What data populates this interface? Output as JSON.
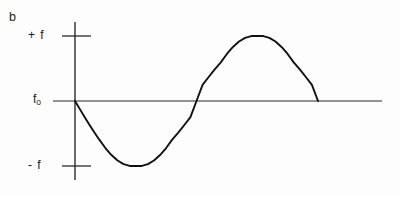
{
  "figure": {
    "panel_letter": "b",
    "background_color": "#fdfdfd",
    "ink_color": "#1a1a1a"
  },
  "axis_labels": {
    "positive_deviation": "+ f",
    "center_frequency_symbol": "f",
    "center_frequency_subscript": "o",
    "negative_deviation": "- f"
  },
  "chart_data": {
    "type": "line",
    "title": "",
    "subtitle": "",
    "xlabel": "",
    "ylabel": "",
    "grid": false,
    "legend_position": "none",
    "annotations": [
      "b"
    ],
    "x": [
      0.0,
      0.02,
      0.04,
      0.06,
      0.08,
      0.1,
      0.125,
      0.15,
      0.175,
      0.2,
      0.225,
      0.25,
      0.275,
      0.3,
      0.325,
      0.35,
      0.375,
      0.4,
      0.425,
      0.45,
      0.475,
      0.5,
      0.525,
      0.55,
      0.575,
      0.6,
      0.625,
      0.65,
      0.675,
      0.7,
      0.725,
      0.75,
      0.775,
      0.8,
      0.825,
      0.85,
      0.875,
      0.9,
      0.925,
      0.95,
      0.975,
      1.0
    ],
    "values": [
      0.0,
      -0.125,
      -0.249,
      -0.369,
      -0.485,
      -0.595,
      -0.724,
      -0.831,
      -0.915,
      -0.972,
      -0.999,
      -1.0,
      -0.999,
      -0.972,
      -0.915,
      -0.831,
      -0.724,
      -0.595,
      -0.485,
      -0.369,
      -0.249,
      0.0,
      0.249,
      0.369,
      0.485,
      0.595,
      0.724,
      0.831,
      0.915,
      0.972,
      0.999,
      1.0,
      0.999,
      0.972,
      0.915,
      0.831,
      0.724,
      0.595,
      0.485,
      0.369,
      0.249,
      0.0
    ],
    "y_tick_values": [
      1,
      0,
      -1
    ],
    "y_tick_labels": [
      "+ f",
      "fo",
      "- f"
    ],
    "x_tick_labels": [],
    "ylim": [
      -1.35,
      1.35
    ],
    "xlim": [
      -0.2,
      1.55
    ],
    "series": [
      {
        "name": "frequency-deviation-waveform",
        "values": [
          0.0,
          -0.125,
          -0.249,
          -0.369,
          -0.485,
          -0.595,
          -0.724,
          -0.831,
          -0.915,
          -0.972,
          -0.999,
          -1.0,
          -0.999,
          -0.972,
          -0.915,
          -0.831,
          -0.724,
          -0.595,
          -0.485,
          -0.369,
          -0.249,
          0.0,
          0.249,
          0.369,
          0.485,
          0.595,
          0.724,
          0.831,
          0.915,
          0.972,
          0.999,
          1.0,
          0.999,
          0.972,
          0.915,
          0.831,
          0.724,
          0.595,
          0.485,
          0.369,
          0.249,
          0.0
        ]
      }
    ],
    "curve_path": "M 75.0 101.0 C 79.5 128.0 86.0 152.0 98.0 161.5 C 110.0 171.0 126.0 167.0 137.0 167.0 C 151.0 167.0 168.0 163.0 180.0 150.0 C 192.0 137.0 194.0 118.0 197.0 101.0 C 200.5 80.0 205.0 60.5 217.0 51.0 C 229.5 41.5 246.0 45.0 260.0 45.0 C 274.0 45.0 291.0 41.5 303.0 55.0 C 313.0 66.5 316.0 84.0 318.0 101.0",
    "axes_geometry": {
      "x_axis_y": 101,
      "x_axis_x_start": 53,
      "x_axis_x_end": 382,
      "y_axis_x": 75,
      "y_axis_y_top": 22,
      "y_axis_y_bottom": 180,
      "tick_plus_f_y": 36,
      "tick_minus_f_y": 166,
      "tick_x_start": 62,
      "tick_x_end": 91
    }
  }
}
